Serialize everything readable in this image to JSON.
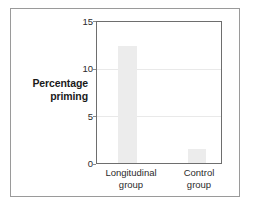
{
  "chart_data": {
    "type": "bar",
    "title": "",
    "xlabel": "",
    "ylabel": "Percentage priming",
    "categories": [
      "Longitudinal group",
      "Control group"
    ],
    "category_lines": [
      [
        "Longitudinal",
        "group"
      ],
      [
        "Control",
        "group"
      ]
    ],
    "values": [
      12.5,
      1.5
    ],
    "ylim": [
      0,
      15
    ],
    "yticks": [
      0,
      5,
      10,
      15
    ],
    "ytick_labels": [
      "0",
      "5",
      "10",
      "15"
    ],
    "gridlines_at": [
      5,
      10
    ],
    "grid": true,
    "legend": "none",
    "bar_color": "#ececec",
    "axis_color": "#6e6e6e",
    "grid_color": "#e9e9e9",
    "frame_color": "#9a9a9a",
    "text_color": "#2b2b2b"
  }
}
